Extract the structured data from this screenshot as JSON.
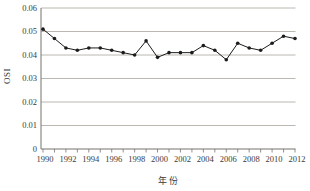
{
  "figure": {
    "background": "#ffffff",
    "line_color": "#1c1c1c",
    "marker_color": "#1c1c1c",
    "gridline_color": "#aaa69d",
    "axis_color": "#77736b",
    "text_color": "#3a3a3a"
  },
  "chart_data": {
    "type": "line",
    "title": "",
    "xlabel": "年份",
    "ylabel": "OSI",
    "x": [
      1990,
      1991,
      1992,
      1993,
      1994,
      1995,
      1996,
      1997,
      1998,
      1999,
      2000,
      2001,
      2002,
      2003,
      2004,
      2005,
      2006,
      2007,
      2008,
      2009,
      2010,
      2011,
      2012
    ],
    "series": [
      {
        "name": "OSI",
        "values": [
          0.051,
          0.047,
          0.043,
          0.042,
          0.043,
          0.043,
          0.042,
          0.041,
          0.04,
          0.046,
          0.039,
          0.041,
          0.041,
          0.041,
          0.044,
          0.042,
          0.038,
          0.045,
          0.043,
          0.042,
          0.045,
          0.048,
          0.047
        ]
      }
    ],
    "ylim": [
      0,
      0.06
    ],
    "ytick_interval": 0.01,
    "ytick_labels": [
      "0",
      "0.01",
      "0.02",
      "0.03",
      "0.04",
      "0.05",
      "0.06"
    ],
    "xtick_labels": [
      "1990",
      "1992",
      "1994",
      "1996",
      "1998",
      "2000",
      "2002",
      "2004",
      "2006",
      "2008",
      "2010",
      "2012"
    ],
    "grid": true,
    "legend_position": "none",
    "marker": "circle"
  }
}
